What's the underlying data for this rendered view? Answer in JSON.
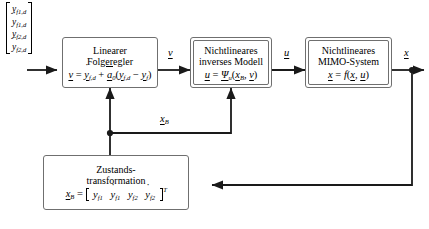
{
  "diagram": {
    "type": "control-block-diagram",
    "language": "de",
    "colors": {
      "background": "#ffffff",
      "line": "#1a1a1a",
      "block_border": "#6f6f6f",
      "text": "#000000"
    }
  },
  "input_vector": {
    "name": "reference-trajectory-vector",
    "bracket_left": "[",
    "bracket_right": "]",
    "entries": [
      {
        "base": "y",
        "accent": "none",
        "sub": "f1,d"
      },
      {
        "base": "y",
        "accent": "dot",
        "sub": "f1,d"
      },
      {
        "base": "y",
        "accent": "none",
        "sub": "f2,d"
      },
      {
        "base": "y",
        "accent": "ddot",
        "sub": "f2,d"
      }
    ],
    "entries_text": [
      "y_f1,d",
      "ẏ_f1,d",
      "y_f2,d",
      "ÿ_f2,d"
    ]
  },
  "blocks": [
    {
      "id": "linearer-folgeregler",
      "title_line1": "Linearer",
      "title_line2": "Folgeregler",
      "equation_text": "v = ẏ_f,d + ā₀(y_f,d − y_f)",
      "double_border": false
    },
    {
      "id": "nichtlineares-inverses-modell",
      "title_line1": "Nichtlineares",
      "title_line2": "inverses Modell",
      "equation_text": "u = Ψ_u(x_B, v)",
      "double_border": true
    },
    {
      "id": "nichtlineares-mimo-system",
      "title_line1": "Nichtlineares",
      "title_line2": "MIMO-System",
      "equation_text": "ẋ = f(x, u)",
      "double_border": true
    },
    {
      "id": "zustandstransformation",
      "title_line1": "Zustands-",
      "title_line2": "transformation",
      "equation_text": "x_B = [ y_f1  ẏ_f1  y_f2  ẏ_f2 ]^T",
      "double_border": false
    }
  ],
  "signals": [
    {
      "id": "v",
      "label": "v",
      "underlined": true
    },
    {
      "id": "u",
      "label": "u",
      "underlined": true
    },
    {
      "id": "x",
      "label": "x",
      "underlined": true
    },
    {
      "id": "xB",
      "label": "x",
      "sub": "B",
      "underlined": true
    }
  ],
  "state_vector_entries": [
    "y_f1",
    "ẏ_f1",
    "y_f2",
    "ẏ_f2"
  ],
  "transpose_symbol": "T"
}
